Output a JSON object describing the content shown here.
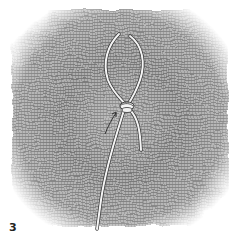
{
  "figure": {
    "label": "3",
    "colors": {
      "background": "#ffffff",
      "gauze_dark": "#6e6e6e",
      "gauze_mid": "#9a9a9a",
      "cord": "#f2f2f2",
      "cord_outline": "#3a3a3a"
    }
  }
}
